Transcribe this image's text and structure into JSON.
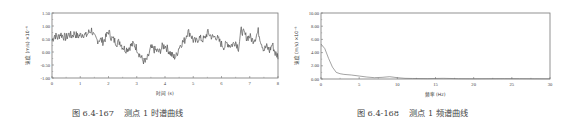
{
  "chart_data": [
    {
      "type": "line",
      "title": "",
      "caption": "图 6.4-167    测点 1 时谱曲线",
      "xlabel": "时间 (s)",
      "ylabel": "速度 (m/s) ×10⁻⁶",
      "xlim": [
        0,
        8
      ],
      "ylim": [
        -1.0,
        1.5
      ],
      "xticks": [
        "0",
        "1",
        "2",
        "3",
        "4",
        "5",
        "6",
        "7",
        "8"
      ],
      "yticks": [
        "1.50",
        "1.00",
        "0.50",
        "0.00",
        "-0.50",
        "-1.00"
      ],
      "grid": false,
      "series": [
        {
          "name": "velocity",
          "x": [
            0,
            0.1,
            0.2,
            0.3,
            0.4,
            0.5,
            0.6,
            0.7,
            0.8,
            0.9,
            1.0,
            1.1,
            1.2,
            1.3,
            1.4,
            1.5,
            1.6,
            1.7,
            1.8,
            1.9,
            2.0,
            2.1,
            2.2,
            2.3,
            2.4,
            2.5,
            2.6,
            2.7,
            2.8,
            2.9,
            3.0,
            3.1,
            3.2,
            3.3,
            3.4,
            3.5,
            3.6,
            3.7,
            3.8,
            3.9,
            4.0,
            4.1,
            4.2,
            4.3,
            4.4,
            4.5,
            4.6,
            4.7,
            4.8,
            4.9,
            5.0,
            5.1,
            5.2,
            5.3,
            5.4,
            5.5,
            5.6,
            5.7,
            5.8,
            5.9,
            6.0,
            6.1,
            6.2,
            6.3,
            6.4,
            6.5,
            6.6,
            6.7,
            6.8,
            6.9,
            7.0,
            7.1,
            7.2,
            7.3,
            7.4,
            7.5,
            7.6,
            7.7,
            7.8,
            7.9,
            8.0
          ],
          "values": [
            0.45,
            0.65,
            0.55,
            0.7,
            0.6,
            0.55,
            0.68,
            0.62,
            0.72,
            0.6,
            0.65,
            0.7,
            0.62,
            0.75,
            0.85,
            0.55,
            0.45,
            0.5,
            0.4,
            0.55,
            0.8,
            0.55,
            0.45,
            0.35,
            0.4,
            0.2,
            0.1,
            0.15,
            0.25,
            0.3,
            0.15,
            -0.1,
            -0.3,
            -0.4,
            -0.2,
            0.15,
            0.1,
            0.05,
            0.0,
            0.2,
            0.25,
            0.1,
            -0.05,
            -0.2,
            -0.15,
            0.2,
            0.35,
            0.45,
            0.8,
            0.7,
            0.45,
            0.4,
            0.55,
            0.48,
            0.5,
            0.75,
            0.65,
            0.55,
            0.6,
            0.45,
            0.3,
            0.2,
            0.35,
            0.25,
            0.3,
            0.4,
            0.15,
            0.85,
            0.7,
            0.55,
            0.6,
            0.45,
            0.55,
            0.8,
            0.4,
            0.1,
            0.2,
            0.05,
            0.3,
            -0.05,
            -0.15
          ]
        }
      ]
    },
    {
      "type": "line",
      "title": "",
      "caption": "图 6.4-168    测点 1 频谱曲线",
      "xlabel": "频率 (Hz)",
      "ylabel": "速度 (m/s) ×10⁻⁶",
      "xlim": [
        0,
        30
      ],
      "ylim": [
        0,
        10
      ],
      "xticks": [
        "0",
        "5",
        "10",
        "15",
        "20",
        "25",
        "30"
      ],
      "yticks": [
        "10.00",
        "8.00",
        "6.00",
        "4.00",
        "2.00",
        "0.00"
      ],
      "grid": false,
      "series": [
        {
          "name": "spectrum",
          "x": [
            0,
            0.5,
            1.0,
            1.5,
            2.0,
            2.5,
            3.0,
            4.0,
            5.0,
            6.0,
            7.0,
            8.0,
            9.0,
            10.0,
            11.0,
            12.0,
            14.0,
            16.0,
            18.0,
            20.0,
            22.0,
            24.0,
            26.0,
            28.0,
            30.0
          ],
          "values": [
            5.3,
            4.6,
            3.1,
            1.8,
            1.0,
            0.8,
            0.7,
            0.6,
            0.45,
            0.3,
            0.2,
            0.25,
            0.35,
            0.2,
            0.1,
            0.08,
            0.06,
            0.1,
            0.05,
            0.04,
            0.05,
            0.06,
            0.05,
            0.04,
            0.03
          ]
        }
      ]
    }
  ]
}
